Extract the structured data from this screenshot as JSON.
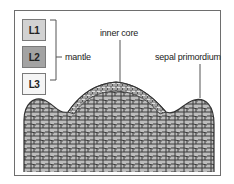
{
  "diagram": {
    "type": "shoot apical meristem cross-section",
    "layers": [
      {
        "id": "L1",
        "label": "L1",
        "fill": "#d2d2d2"
      },
      {
        "id": "L2",
        "label": "L2",
        "fill": "#a3a3a3"
      },
      {
        "id": "L3",
        "label": "L3",
        "fill": "#f5f5f5"
      }
    ],
    "labels": {
      "mantle": "mantle",
      "inner_core": "inner core",
      "sepal_primordium": "sepal primordium"
    },
    "colors": {
      "frame": "#6e6e6e",
      "cell_wall": "#3a3a3a",
      "cell_fill": "#bdbdbd",
      "outer_cell_fill": "#e6e6e6"
    }
  }
}
